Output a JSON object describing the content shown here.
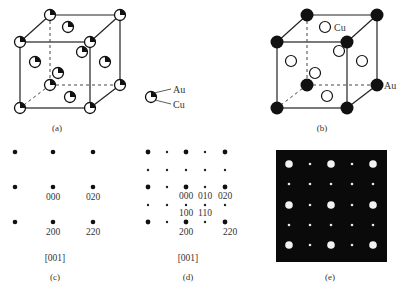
{
  "colors": {
    "background": "#ffffff",
    "line": "#222222",
    "atom_dark": "#111111",
    "pattern_bg": "#0a0a0a",
    "pattern_spot": "#f2f2f2",
    "text": "#333333"
  },
  "panel_a": {
    "caption": "(a)",
    "legend": {
      "au_label": "Au",
      "cu_label": "Cu"
    },
    "description": "Disordered fcc AuCu3 unit cell: each site partially occupied (mixed Au/Cu)"
  },
  "panel_b": {
    "caption": "(b)",
    "cu_label": "Cu",
    "au_label": "Au",
    "description": "Ordered AuCu3 (L1_2): Au at corners (filled), Cu at face centers (open)"
  },
  "panel_c": {
    "caption": "(c)",
    "zone_axis": "[001]",
    "spot_labels": [
      "000",
      "020",
      "200",
      "220"
    ]
  },
  "panel_d": {
    "caption": "(d)",
    "zone_axis": "[001]",
    "spot_labels": [
      "000",
      "010",
      "020",
      "100",
      "110",
      "200",
      "220"
    ]
  },
  "panel_e": {
    "caption": "(e)",
    "description": "Simulated diffraction pattern: bright fundamental spots and weak superlattice spots on black background"
  }
}
